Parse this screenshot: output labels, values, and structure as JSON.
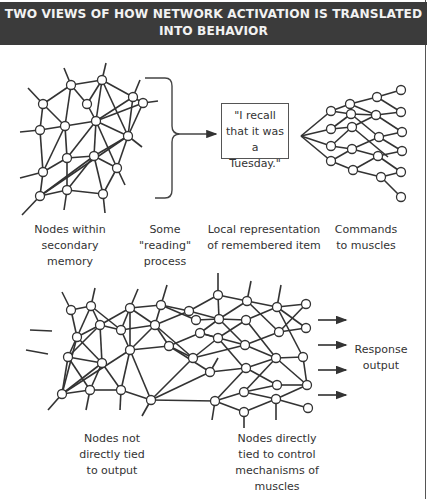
{
  "title": {
    "line1": "TWO VIEWS OF HOW NETWORK ACTIVATION IS TRANSLATED",
    "line2": "INTO BEHAVIOR"
  },
  "colors": {
    "header_bg": "#3b3b3b",
    "header_text": "#f2f2f2",
    "line": "#333333",
    "node_fill": "#ffffff"
  },
  "top_view": {
    "quote_box": {
      "line1": "\"I recall",
      "line2": "that it was a",
      "line3": "Tuesday.\""
    },
    "labels": [
      {
        "line1": "Nodes within",
        "line2": "secondary",
        "line3": "memory"
      },
      {
        "line1": "Some",
        "line2": "\"reading\"",
        "line3": "process"
      },
      {
        "line1": "Local representation",
        "line2": "of remembered item"
      },
      {
        "line1": "Commands",
        "line2": "to muscles"
      }
    ]
  },
  "bottom_view": {
    "response_label": {
      "line1": "Response",
      "line2": "output"
    },
    "labels": [
      {
        "line1": "Nodes not",
        "line2": "directly tied",
        "line3": "to output"
      },
      {
        "line1": "Nodes directly",
        "line2": "tied to control",
        "line3": "mechanisms of",
        "line4": "muscles"
      }
    ],
    "arrow_count": 4
  }
}
